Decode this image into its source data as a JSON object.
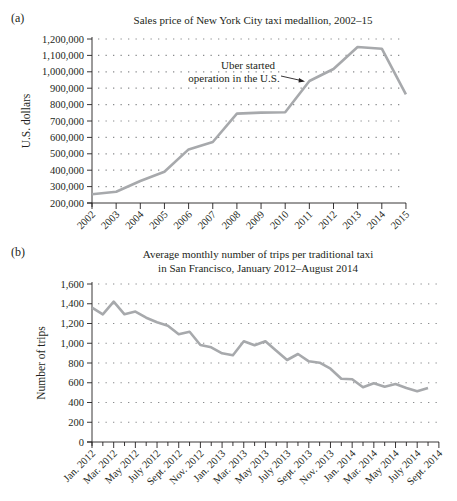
{
  "chart_data": [
    {
      "panel_label": "(a)",
      "type": "line",
      "title": "Sales price of New York City taxi medallion, 2002–15",
      "xlabel": "",
      "ylabel": "U.S. dollars",
      "ylim": [
        200000,
        1200000
      ],
      "yticks": [
        200000,
        300000,
        400000,
        500000,
        600000,
        700000,
        800000,
        900000,
        1000000,
        1100000,
        1200000
      ],
      "ytick_labels": [
        "200,000",
        "300,000",
        "400,000",
        "500,000",
        "600,000",
        "700,000",
        "800,000",
        "900,000",
        "1,000,000",
        "1,100,000",
        "1,200,000"
      ],
      "categories": [
        "2002",
        "2003",
        "2004",
        "2005",
        "2006",
        "2007",
        "2008",
        "2009",
        "2010",
        "2011",
        "2012",
        "2013",
        "2014",
        "2015"
      ],
      "values": [
        253000,
        269000,
        334000,
        391000,
        527000,
        572000,
        745000,
        751000,
        753000,
        944000,
        1017000,
        1151000,
        1141000,
        863000
      ],
      "grid": "horizontal dotted",
      "line_color": "#a7a9ac",
      "annotations": [
        {
          "text_line1": "Uber started",
          "text_line2": "operation in the U.S.",
          "points_to": "2011"
        }
      ]
    },
    {
      "panel_label": "(b)",
      "type": "line",
      "title_line1": "Average monthly number of trips per traditional taxi",
      "title_line2": "in San Francisco, January 2012–August 2014",
      "xlabel": "",
      "ylabel": "Number of trips",
      "ylim": [
        0,
        1600
      ],
      "yticks": [
        0,
        200,
        400,
        600,
        800,
        1000,
        1200,
        1400,
        1600
      ],
      "ytick_labels": [
        "0",
        "200",
        "400",
        "600",
        "800",
        "1,000",
        "1,200",
        "1,400",
        "1,600"
      ],
      "xtick_labels": [
        "Jan. 2012",
        "Mar. 2012",
        "May 2012",
        "July 2012",
        "Sept. 2012",
        "Nov. 2012",
        "Jan. 2013",
        "Mar. 2013",
        "May 2013",
        "July 2013",
        "Sept. 2013",
        "Nov. 2013",
        "Jan. 2014",
        "Mar. 2014",
        "May 2014",
        "July 2014",
        "Sept. 2014"
      ],
      "categories": [
        "Jan 2012",
        "Feb 2012",
        "Mar 2012",
        "Apr 2012",
        "May 2012",
        "Jun 2012",
        "Jul 2012",
        "Aug 2012",
        "Sep 2012",
        "Oct 2012",
        "Nov 2012",
        "Dec 2012",
        "Jan 2013",
        "Feb 2013",
        "Mar 2013",
        "Apr 2013",
        "May 2013",
        "Jun 2013",
        "Jul 2013",
        "Aug 2013",
        "Sep 2013",
        "Oct 2013",
        "Nov 2013",
        "Dec 2013",
        "Jan 2014",
        "Feb 2014",
        "Mar 2014",
        "Apr 2014",
        "May 2014",
        "Jun 2014",
        "Jul 2014",
        "Aug 2014"
      ],
      "values": [
        1360,
        1293,
        1421,
        1293,
        1320,
        1259,
        1212,
        1178,
        1091,
        1117,
        982,
        959,
        898,
        878,
        1020,
        979,
        1020,
        925,
        830,
        891,
        817,
        803,
        742,
        641,
        635,
        554,
        594,
        560,
        587,
        547,
        513,
        547
      ],
      "grid": "horizontal dotted",
      "line_color": "#a7a9ac"
    }
  ]
}
